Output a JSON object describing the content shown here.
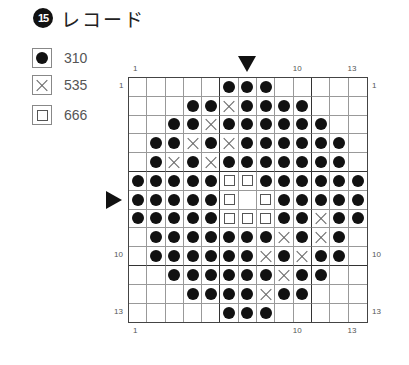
{
  "title": {
    "number": "15",
    "text": "レコード"
  },
  "legend": [
    {
      "symbol": "dot",
      "code": "310"
    },
    {
      "symbol": "cross",
      "code": "535"
    },
    {
      "symbol": "square",
      "code": "666"
    }
  ],
  "axis": {
    "top": [
      {
        "label": "1",
        "col": 1
      },
      {
        "label": "10",
        "col": 10
      },
      {
        "label": "13",
        "col": 13
      }
    ],
    "bottom": [
      {
        "label": "1",
        "col": 1
      },
      {
        "label": "10",
        "col": 10
      },
      {
        "label": "13",
        "col": 13
      }
    ],
    "left": [
      {
        "label": "1",
        "row": 1
      },
      {
        "label": "10",
        "row": 10
      },
      {
        "label": "13",
        "row": 13
      }
    ],
    "right": [
      {
        "label": "1",
        "row": 1
      },
      {
        "label": "10",
        "row": 10
      },
      {
        "label": "13",
        "row": 13
      }
    ]
  },
  "center_markers": {
    "top_col": 7,
    "left_row": 7
  },
  "grid": {
    "cols": 13,
    "rows": 13,
    "key": {
      "o": "dot",
      "x": "cross",
      "s": "square",
      ".": "empty"
    },
    "pattern": [
      ".....ooo.....",
      "...ooxoooo...",
      "..ooxoooooo..",
      ".ooxoxoooooo.",
      ".oxoxooooooo.",
      "ooooossoooooo",
      "ooooos.sooooo",
      "ooooosssooxoo",
      ".oooooooxoxo.",
      ".ooooooxoxoo.",
      "..ooooooxoo..",
      "...ooooxoo...",
      ".....ooo....."
    ]
  }
}
